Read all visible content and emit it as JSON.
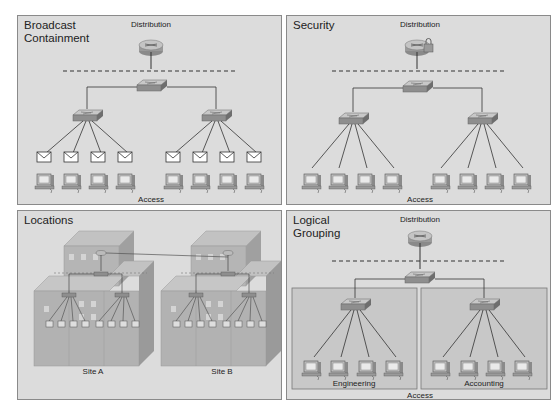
{
  "panels": [
    {
      "id": "broadcast",
      "title": "Broadcast\nContainment",
      "distribution_label": "Distribution",
      "access_label": "Access"
    },
    {
      "id": "security",
      "title": "Security",
      "distribution_label": "Distribution",
      "access_label": "Access"
    },
    {
      "id": "locations",
      "title": "Locations",
      "sites": [
        "Site A",
        "Site B"
      ]
    },
    {
      "id": "logical",
      "title": "Logical\nGrouping",
      "distribution_label": "Distribution",
      "access_label": "Access",
      "groups": [
        "Engineering",
        "Accounting"
      ]
    }
  ],
  "colors": {
    "panel_bg": "#dcdcdc",
    "group_bg": "#c8c8c8",
    "line": "#333333",
    "dashed": "#333333"
  }
}
